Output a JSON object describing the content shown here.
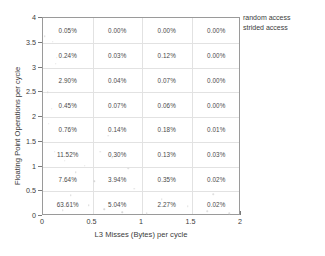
{
  "chart_data": {
    "type": "heatmap",
    "title": "",
    "xlabel": "L3 Misses (Bytes) per cycle",
    "ylabel": "Floating Point Operations per cycle",
    "xlim": [
      0,
      2
    ],
    "ylim": [
      0,
      4
    ],
    "xticks": [
      "0",
      "0.5",
      "1",
      "1.5",
      "2"
    ],
    "yticks": [
      "0",
      "0.5",
      "1",
      "1.5",
      "2",
      "2.5",
      "3",
      "3.5",
      "4"
    ],
    "grid": true,
    "legend_position": "outside-top-right",
    "legend": [
      "random access",
      "strided access"
    ],
    "x_bins": [
      [
        0,
        0.5
      ],
      [
        0.5,
        1
      ],
      [
        1,
        1.5
      ],
      [
        1.5,
        2
      ]
    ],
    "y_bins": [
      [
        0,
        0.5
      ],
      [
        0.5,
        1
      ],
      [
        1,
        1.5
      ],
      [
        1.5,
        2
      ],
      [
        2,
        2.5
      ],
      [
        2.5,
        3
      ],
      [
        3,
        3.5
      ],
      [
        3.5,
        4
      ]
    ],
    "cell_labels_top_to_bottom": [
      [
        "0.05%",
        "0.00%",
        "0.00%",
        "0.00%"
      ],
      [
        "0.24%",
        "0.03%",
        "0.12%",
        "0.00%"
      ],
      [
        "2.90%",
        "0.04%",
        "0.07%",
        "0.00%"
      ],
      [
        "0.45%",
        "0.07%",
        "0.06%",
        "0.00%"
      ],
      [
        "0.76%",
        "0.14%",
        "0.18%",
        "0.01%"
      ],
      [
        "11.52%",
        "0.30%",
        "0.13%",
        "0.03%"
      ],
      [
        "7.64%",
        "3.94%",
        "0.35%",
        "0.02%"
      ],
      [
        "63.61%",
        "5.04%",
        "2.27%",
        "0.02%"
      ]
    ],
    "cells": [
      {
        "x_bin": 0,
        "y_bin": 7,
        "value": 0.05,
        "label": "0.05%"
      },
      {
        "x_bin": 1,
        "y_bin": 7,
        "value": 0.0,
        "label": "0.00%"
      },
      {
        "x_bin": 2,
        "y_bin": 7,
        "value": 0.0,
        "label": "0.00%"
      },
      {
        "x_bin": 3,
        "y_bin": 7,
        "value": 0.0,
        "label": "0.00%"
      },
      {
        "x_bin": 0,
        "y_bin": 6,
        "value": 0.24,
        "label": "0.24%"
      },
      {
        "x_bin": 1,
        "y_bin": 6,
        "value": 0.03,
        "label": "0.03%"
      },
      {
        "x_bin": 2,
        "y_bin": 6,
        "value": 0.12,
        "label": "0.12%"
      },
      {
        "x_bin": 3,
        "y_bin": 6,
        "value": 0.0,
        "label": "0.00%"
      },
      {
        "x_bin": 0,
        "y_bin": 5,
        "value": 2.9,
        "label": "2.90%"
      },
      {
        "x_bin": 1,
        "y_bin": 5,
        "value": 0.04,
        "label": "0.04%"
      },
      {
        "x_bin": 2,
        "y_bin": 5,
        "value": 0.07,
        "label": "0.07%"
      },
      {
        "x_bin": 3,
        "y_bin": 5,
        "value": 0.0,
        "label": "0.00%"
      },
      {
        "x_bin": 0,
        "y_bin": 4,
        "value": 0.45,
        "label": "0.45%"
      },
      {
        "x_bin": 1,
        "y_bin": 4,
        "value": 0.07,
        "label": "0.07%"
      },
      {
        "x_bin": 2,
        "y_bin": 4,
        "value": 0.06,
        "label": "0.06%"
      },
      {
        "x_bin": 3,
        "y_bin": 4,
        "value": 0.0,
        "label": "0.00%"
      },
      {
        "x_bin": 0,
        "y_bin": 3,
        "value": 0.76,
        "label": "0.76%"
      },
      {
        "x_bin": 1,
        "y_bin": 3,
        "value": 0.14,
        "label": "0.14%"
      },
      {
        "x_bin": 2,
        "y_bin": 3,
        "value": 0.18,
        "label": "0.18%"
      },
      {
        "x_bin": 3,
        "y_bin": 3,
        "value": 0.01,
        "label": "0.01%"
      },
      {
        "x_bin": 0,
        "y_bin": 2,
        "value": 11.52,
        "label": "11.52%"
      },
      {
        "x_bin": 1,
        "y_bin": 2,
        "value": 0.3,
        "label": "0.30%"
      },
      {
        "x_bin": 2,
        "y_bin": 2,
        "value": 0.13,
        "label": "0.13%"
      },
      {
        "x_bin": 3,
        "y_bin": 2,
        "value": 0.03,
        "label": "0.03%"
      },
      {
        "x_bin": 0,
        "y_bin": 1,
        "value": 7.64,
        "label": "7.64%"
      },
      {
        "x_bin": 1,
        "y_bin": 1,
        "value": 3.94,
        "label": "3.94%"
      },
      {
        "x_bin": 2,
        "y_bin": 1,
        "value": 0.35,
        "label": "0.35%"
      },
      {
        "x_bin": 3,
        "y_bin": 1,
        "value": 0.02,
        "label": "0.02%"
      },
      {
        "x_bin": 0,
        "y_bin": 0,
        "value": 63.61,
        "label": "63.61%"
      },
      {
        "x_bin": 1,
        "y_bin": 0,
        "value": 5.04,
        "label": "5.04%"
      },
      {
        "x_bin": 2,
        "y_bin": 0,
        "value": 2.27,
        "label": "2.27%"
      },
      {
        "x_bin": 3,
        "y_bin": 0,
        "value": 0.02,
        "label": "0.02%"
      }
    ],
    "scatter": {
      "random access": [
        [
          0.02,
          3.63
        ],
        [
          0.1,
          3.52
        ],
        [
          0.14,
          3.2
        ],
        [
          0.13,
          3.08
        ],
        [
          0.18,
          2.7
        ],
        [
          0.05,
          2.5
        ],
        [
          0.09,
          2.17
        ],
        [
          0.06,
          1.86
        ],
        [
          0.3,
          1.74
        ],
        [
          0.12,
          1.3
        ],
        [
          0.22,
          1.12
        ],
        [
          0.42,
          1.02
        ],
        [
          0.33,
          0.88
        ],
        [
          0.52,
          0.7
        ],
        [
          0.28,
          0.42
        ],
        [
          0.46,
          0.22
        ],
        [
          0.2,
          0.12
        ],
        [
          0.62,
          0.14
        ],
        [
          0.8,
          0.08
        ],
        [
          1.05,
          0.06
        ]
      ],
      "strided access": [
        [
          0.66,
          1.62
        ],
        [
          0.58,
          1.3
        ],
        [
          0.7,
          1.18
        ],
        [
          0.86,
          0.96
        ],
        [
          0.92,
          0.55
        ],
        [
          1.2,
          0.34
        ],
        [
          1.46,
          0.2
        ],
        [
          1.66,
          0.1
        ],
        [
          1.88,
          0.06
        ],
        [
          1.72,
          0.44
        ]
      ]
    },
    "colors": {
      "axis": "#9a9a9a",
      "grid": "#e2e2e2",
      "text": "#3b3b3b",
      "cell_text": "#4a4a4a",
      "random_access": "#d8d8d8",
      "strided_access": "#e0e0e0"
    }
  }
}
